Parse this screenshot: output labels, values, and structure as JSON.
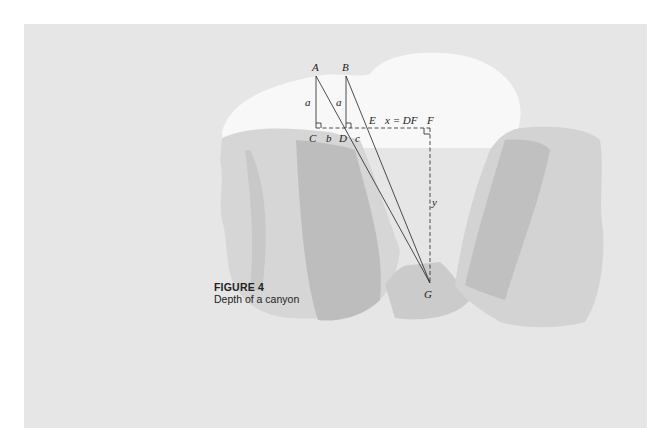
{
  "figure": {
    "number_label": "FIGURE 4",
    "caption": "Depth of a canyon"
  },
  "labels": {
    "A": "A",
    "B": "B",
    "C": "C",
    "D": "D",
    "E": "E",
    "F": "F",
    "G": "G",
    "a1": "a",
    "a2": "a",
    "b": "b",
    "c": "c",
    "x_eq": "x = DF",
    "y": "y"
  },
  "colors": {
    "background": "#e6e6e6",
    "snow": "#f8f8f8",
    "rock_light": "#d4d4d4",
    "rock_mid": "#c4c4c4",
    "rock_dark": "#b2b2b2",
    "floor": "#cfcfcf",
    "line": "#222222"
  }
}
